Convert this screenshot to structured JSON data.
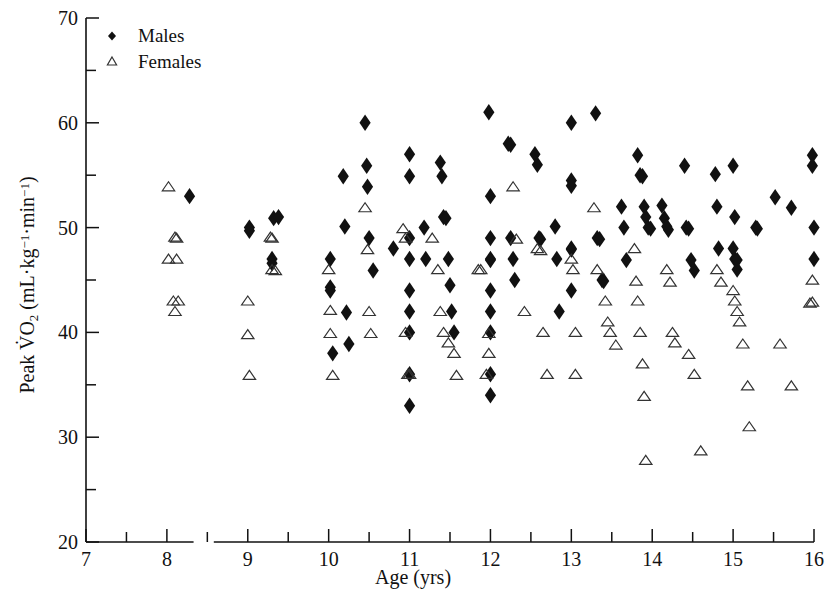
{
  "figure": {
    "background": "#ffffff",
    "ink": "#111111"
  },
  "chart_data": {
    "type": "scatter",
    "title": "",
    "xlabel": "Age (yrs)",
    "ylabel": "Peak VO2 (mL·kg−1·min−1)",
    "ylabel_parts": {
      "lead": "Peak ",
      "v_dot": "V̇",
      "o": "O",
      "o_sub": "2",
      "unit_open": " (mL·kg",
      "unit_sup1": "−1",
      "unit_mid": "·min",
      "unit_sup2": "−1",
      "unit_close": ")"
    },
    "xlim": [
      7,
      16
    ],
    "ylim": [
      20,
      70
    ],
    "xticks": [
      7,
      8,
      9,
      10,
      11,
      12,
      13,
      14,
      15,
      16
    ],
    "xtick_labels": [
      "7",
      "8",
      "9",
      "10",
      "11",
      "12",
      "13",
      "14",
      "15",
      "16"
    ],
    "xminorticks": [
      7.5,
      8.5,
      9.5,
      10.5,
      11.5,
      12.5,
      13.5,
      14.5,
      15.5
    ],
    "yticks": [
      20,
      30,
      40,
      50,
      60,
      70
    ],
    "ytick_labels": [
      "20",
      "30",
      "40",
      "50",
      "60",
      "70"
    ],
    "yminorticks": [
      25,
      35,
      45,
      55,
      65
    ],
    "grid": false,
    "legend_position": "top-left",
    "axis_break_x": [
      8.33,
      8.58
    ],
    "series": [
      {
        "name": "Males",
        "marker": "filled-diamond",
        "color": "#111111",
        "points": [
          [
            8.28,
            53.0
          ],
          [
            9.02,
            50.0
          ],
          [
            9.02,
            49.7
          ],
          [
            9.3,
            47.0
          ],
          [
            9.3,
            46.6
          ],
          [
            9.32,
            50.9
          ],
          [
            9.38,
            51.0
          ],
          [
            10.02,
            47.0
          ],
          [
            10.02,
            44.3
          ],
          [
            10.02,
            44.0
          ],
          [
            10.05,
            38.0
          ],
          [
            10.18,
            54.9
          ],
          [
            10.2,
            50.1
          ],
          [
            10.22,
            41.9
          ],
          [
            10.25,
            38.9
          ],
          [
            10.45,
            60.0
          ],
          [
            10.47,
            55.9
          ],
          [
            10.48,
            53.9
          ],
          [
            10.5,
            49.0
          ],
          [
            10.55,
            45.9
          ],
          [
            10.8,
            48.0
          ],
          [
            11.0,
            57.0
          ],
          [
            11.0,
            54.9
          ],
          [
            11.0,
            49.0
          ],
          [
            11.0,
            47.0
          ],
          [
            11.0,
            44.0
          ],
          [
            11.0,
            42.0
          ],
          [
            11.0,
            40.0
          ],
          [
            11.0,
            36.0
          ],
          [
            11.0,
            33.0
          ],
          [
            11.18,
            50.0
          ],
          [
            11.2,
            47.0
          ],
          [
            11.38,
            56.2
          ],
          [
            11.4,
            54.9
          ],
          [
            11.42,
            51.0
          ],
          [
            11.45,
            50.9
          ],
          [
            11.48,
            47.0
          ],
          [
            11.5,
            44.5
          ],
          [
            11.52,
            42.0
          ],
          [
            11.55,
            40.0
          ],
          [
            11.98,
            61.0
          ],
          [
            12.0,
            53.0
          ],
          [
            12.0,
            49.0
          ],
          [
            12.0,
            47.0
          ],
          [
            12.0,
            46.9
          ],
          [
            12.0,
            44.0
          ],
          [
            12.0,
            42.0
          ],
          [
            12.0,
            40.0
          ],
          [
            12.0,
            36.0
          ],
          [
            12.0,
            34.0
          ],
          [
            12.22,
            58.0
          ],
          [
            12.25,
            57.9
          ],
          [
            12.25,
            49.0
          ],
          [
            12.28,
            47.0
          ],
          [
            12.3,
            45.0
          ],
          [
            12.55,
            57.0
          ],
          [
            12.58,
            56.0
          ],
          [
            12.6,
            49.0
          ],
          [
            12.62,
            48.9
          ],
          [
            12.8,
            50.1
          ],
          [
            12.82,
            47.0
          ],
          [
            12.85,
            42.0
          ],
          [
            13.0,
            60.0
          ],
          [
            13.0,
            54.5
          ],
          [
            13.0,
            54.0
          ],
          [
            13.0,
            48.0
          ],
          [
            13.0,
            47.9
          ],
          [
            13.0,
            44.0
          ],
          [
            13.3,
            60.9
          ],
          [
            13.32,
            49.0
          ],
          [
            13.35,
            48.9
          ],
          [
            13.38,
            45.0
          ],
          [
            13.4,
            44.9
          ],
          [
            13.62,
            52.0
          ],
          [
            13.65,
            50.0
          ],
          [
            13.68,
            46.9
          ],
          [
            13.82,
            56.9
          ],
          [
            13.85,
            55.0
          ],
          [
            13.88,
            54.9
          ],
          [
            13.9,
            52.0
          ],
          [
            13.92,
            51.0
          ],
          [
            13.95,
            50.0
          ],
          [
            13.98,
            49.9
          ],
          [
            14.12,
            52.1
          ],
          [
            14.15,
            50.9
          ],
          [
            14.18,
            50.1
          ],
          [
            14.2,
            49.8
          ],
          [
            14.4,
            55.9
          ],
          [
            14.42,
            50.0
          ],
          [
            14.45,
            49.9
          ],
          [
            14.48,
            46.9
          ],
          [
            14.52,
            45.9
          ],
          [
            14.78,
            55.1
          ],
          [
            14.8,
            52.0
          ],
          [
            14.82,
            48.0
          ],
          [
            15.0,
            55.9
          ],
          [
            15.02,
            51.0
          ],
          [
            15.0,
            48.0
          ],
          [
            15.02,
            47.0
          ],
          [
            15.05,
            46.9
          ],
          [
            15.05,
            46.0
          ],
          [
            15.28,
            50.0
          ],
          [
            15.3,
            49.9
          ],
          [
            15.52,
            52.9
          ],
          [
            15.72,
            51.9
          ],
          [
            15.98,
            56.9
          ],
          [
            15.98,
            55.9
          ],
          [
            16.0,
            50.0
          ],
          [
            16.0,
            47.0
          ]
        ]
      },
      {
        "name": "Females",
        "marker": "open-triangle",
        "color": "#333333",
        "points": [
          [
            8.02,
            53.9
          ],
          [
            8.1,
            49.1
          ],
          [
            8.12,
            49.0
          ],
          [
            8.02,
            47.0
          ],
          [
            8.12,
            47.0
          ],
          [
            8.08,
            43.0
          ],
          [
            8.14,
            43.0
          ],
          [
            8.1,
            42.0
          ],
          [
            9.0,
            43.0
          ],
          [
            9.0,
            39.8
          ],
          [
            9.02,
            35.9
          ],
          [
            9.28,
            49.1
          ],
          [
            9.3,
            49.0
          ],
          [
            9.3,
            46.0
          ],
          [
            9.34,
            45.9
          ],
          [
            10.0,
            46.0
          ],
          [
            10.02,
            42.1
          ],
          [
            10.02,
            39.9
          ],
          [
            10.05,
            35.9
          ],
          [
            10.45,
            51.9
          ],
          [
            10.48,
            47.9
          ],
          [
            10.5,
            42.0
          ],
          [
            10.52,
            39.9
          ],
          [
            10.92,
            49.9
          ],
          [
            10.95,
            49.0
          ],
          [
            10.95,
            40.0
          ],
          [
            10.98,
            36.0
          ],
          [
            11.0,
            36.0
          ],
          [
            11.28,
            49.0
          ],
          [
            11.35,
            46.0
          ],
          [
            11.38,
            42.0
          ],
          [
            11.42,
            40.0
          ],
          [
            11.48,
            39.0
          ],
          [
            11.55,
            38.0
          ],
          [
            11.58,
            35.9
          ],
          [
            11.85,
            46.0
          ],
          [
            11.88,
            46.0
          ],
          [
            11.98,
            39.9
          ],
          [
            11.98,
            38.0
          ],
          [
            11.95,
            36.0
          ],
          [
            12.28,
            53.9
          ],
          [
            12.32,
            48.9
          ],
          [
            12.42,
            42.0
          ],
          [
            12.58,
            48.0
          ],
          [
            12.62,
            47.8
          ],
          [
            12.65,
            40.0
          ],
          [
            12.7,
            36.0
          ],
          [
            13.0,
            47.0
          ],
          [
            13.02,
            46.0
          ],
          [
            13.05,
            40.0
          ],
          [
            13.05,
            36.0
          ],
          [
            13.28,
            51.9
          ],
          [
            13.32,
            46.0
          ],
          [
            13.42,
            43.0
          ],
          [
            13.45,
            41.0
          ],
          [
            13.48,
            40.0
          ],
          [
            13.55,
            38.8
          ],
          [
            13.78,
            48.0
          ],
          [
            13.8,
            44.9
          ],
          [
            13.82,
            43.0
          ],
          [
            13.85,
            40.0
          ],
          [
            13.88,
            37.0
          ],
          [
            13.9,
            33.9
          ],
          [
            13.92,
            27.8
          ],
          [
            14.18,
            46.0
          ],
          [
            14.22,
            44.8
          ],
          [
            14.25,
            40.0
          ],
          [
            14.28,
            39.0
          ],
          [
            14.45,
            37.9
          ],
          [
            14.52,
            36.0
          ],
          [
            14.6,
            28.7
          ],
          [
            14.8,
            46.0
          ],
          [
            14.85,
            44.8
          ],
          [
            15.0,
            44.0
          ],
          [
            15.02,
            43.0
          ],
          [
            15.05,
            42.0
          ],
          [
            15.08,
            41.0
          ],
          [
            15.12,
            38.9
          ],
          [
            15.18,
            34.9
          ],
          [
            15.2,
            31.0
          ],
          [
            15.58,
            38.9
          ],
          [
            15.72,
            34.9
          ],
          [
            15.98,
            45.0
          ],
          [
            15.98,
            42.9
          ],
          [
            15.95,
            42.8
          ]
        ]
      }
    ]
  },
  "legend": {
    "entries": [
      {
        "label": "Males",
        "marker": "filled-diamond"
      },
      {
        "label": "Females",
        "marker": "open-triangle"
      }
    ]
  }
}
